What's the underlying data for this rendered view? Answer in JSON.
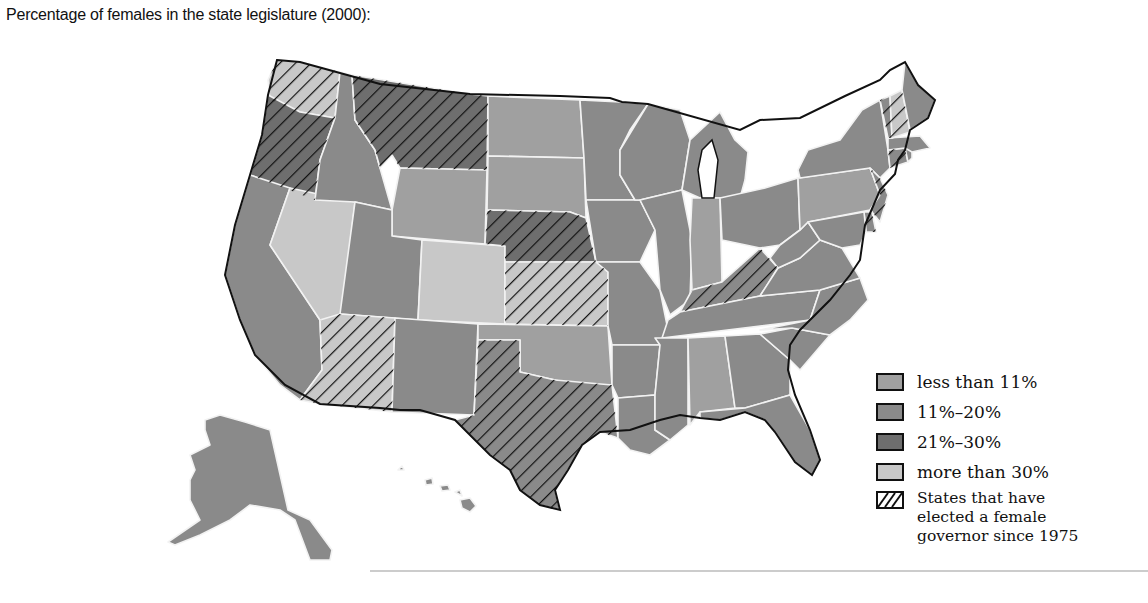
{
  "title": "Percentage of females in the state legislature (2000):",
  "colors": {
    "less_than_11": "#a0a0a0",
    "11_20": "#8a8a8a",
    "21_30": "#6e6e6e",
    "more_than_30": "#c8c8c8",
    "hatch": "#111111",
    "border": "#f2f2f2"
  },
  "legend": {
    "items": [
      {
        "key": "less_than_11",
        "label": "less than 11%"
      },
      {
        "key": "11_20",
        "label": "11%–20%"
      },
      {
        "key": "21_30",
        "label": "21%–30%"
      },
      {
        "key": "more_than_30",
        "label": "more than 30%"
      }
    ],
    "hatch_label": "States that have elected a female governor since 1975"
  },
  "map_data": {
    "type": "choropleth",
    "region": "United States",
    "year": 2000,
    "states": {
      "WA": {
        "category": "more_than_30",
        "female_governor": true
      },
      "OR": {
        "category": "21_30",
        "female_governor": true
      },
      "CA": {
        "category": "11_20",
        "female_governor": false
      },
      "NV": {
        "category": "more_than_30",
        "female_governor": false
      },
      "ID": {
        "category": "11_20",
        "female_governor": false
      },
      "MT": {
        "category": "21_30",
        "female_governor": true
      },
      "WY": {
        "category": "less_than_11",
        "female_governor": false
      },
      "UT": {
        "category": "11_20",
        "female_governor": false
      },
      "AZ": {
        "category": "more_than_30",
        "female_governor": true
      },
      "CO": {
        "category": "more_than_30",
        "female_governor": false
      },
      "NM": {
        "category": "11_20",
        "female_governor": false
      },
      "ND": {
        "category": "less_than_11",
        "female_governor": false
      },
      "SD": {
        "category": "less_than_11",
        "female_governor": false
      },
      "NE": {
        "category": "21_30",
        "female_governor": true
      },
      "KS": {
        "category": "more_than_30",
        "female_governor": true
      },
      "OK": {
        "category": "less_than_11",
        "female_governor": false
      },
      "TX": {
        "category": "11_20",
        "female_governor": true
      },
      "MN": {
        "category": "11_20",
        "female_governor": false
      },
      "IA": {
        "category": "11_20",
        "female_governor": false
      },
      "MO": {
        "category": "11_20",
        "female_governor": false
      },
      "AR": {
        "category": "11_20",
        "female_governor": false
      },
      "LA": {
        "category": "11_20",
        "female_governor": false
      },
      "WI": {
        "category": "11_20",
        "female_governor": false
      },
      "IL": {
        "category": "11_20",
        "female_governor": false
      },
      "MI": {
        "category": "11_20",
        "female_governor": false
      },
      "IN": {
        "category": "less_than_11",
        "female_governor": false
      },
      "OH": {
        "category": "11_20",
        "female_governor": false
      },
      "KY": {
        "category": "11_20",
        "female_governor": true
      },
      "TN": {
        "category": "11_20",
        "female_governor": false
      },
      "MS": {
        "category": "11_20",
        "female_governor": false
      },
      "AL": {
        "category": "less_than_11",
        "female_governor": false
      },
      "GA": {
        "category": "11_20",
        "female_governor": false
      },
      "FL": {
        "category": "11_20",
        "female_governor": false
      },
      "SC": {
        "category": "11_20",
        "female_governor": false
      },
      "NC": {
        "category": "11_20",
        "female_governor": false
      },
      "VA": {
        "category": "11_20",
        "female_governor": false
      },
      "WV": {
        "category": "11_20",
        "female_governor": false
      },
      "PA": {
        "category": "less_than_11",
        "female_governor": false
      },
      "NY": {
        "category": "11_20",
        "female_governor": false
      },
      "NJ": {
        "category": "11_20",
        "female_governor": true
      },
      "DE": {
        "category": "11_20",
        "female_governor": true
      },
      "MD": {
        "category": "11_20",
        "female_governor": false
      },
      "CT": {
        "category": "11_20",
        "female_governor": true
      },
      "RI": {
        "category": "11_20",
        "female_governor": false
      },
      "MA": {
        "category": "11_20",
        "female_governor": false
      },
      "VT": {
        "category": "11_20",
        "female_governor": true
      },
      "NH": {
        "category": "more_than_30",
        "female_governor": true
      },
      "ME": {
        "category": "11_20",
        "female_governor": false
      },
      "AK": {
        "category": "11_20",
        "female_governor": false
      },
      "HI": {
        "category": "11_20",
        "female_governor": false
      }
    }
  }
}
